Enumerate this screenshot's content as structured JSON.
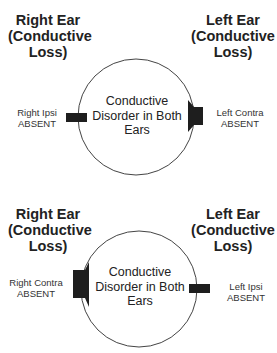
{
  "panels": [
    {
      "left_title": [
        "Right Ear",
        "(Conductive",
        "Loss)"
      ],
      "right_title": [
        "Left Ear",
        "(Conductive",
        "Loss)"
      ],
      "center_text": [
        "Conductive",
        "Disorder in Both",
        "Ears"
      ],
      "left_probe": {
        "type": "ipsi",
        "label": [
          "Right Ipsi",
          "ABSENT"
        ]
      },
      "right_probe": {
        "type": "contra",
        "label": [
          "Left Contra",
          "ABSENT"
        ]
      }
    },
    {
      "left_title": [
        "Right Ear",
        "(Conductive",
        "Loss)"
      ],
      "right_title": [
        "Left Ear",
        "(Conductive",
        "Loss)"
      ],
      "center_text": [
        "Conductive",
        "Disorder in Both",
        "Ears"
      ],
      "left_probe": {
        "type": "contra",
        "label": [
          "Right Contra",
          "ABSENT"
        ]
      },
      "right_probe": {
        "type": "ipsi",
        "label": [
          "Left Ipsi",
          "ABSENT"
        ]
      }
    }
  ],
  "colors": {
    "stroke": "#444444",
    "probe_fill": "#1e1e1e",
    "text": "#222222"
  }
}
